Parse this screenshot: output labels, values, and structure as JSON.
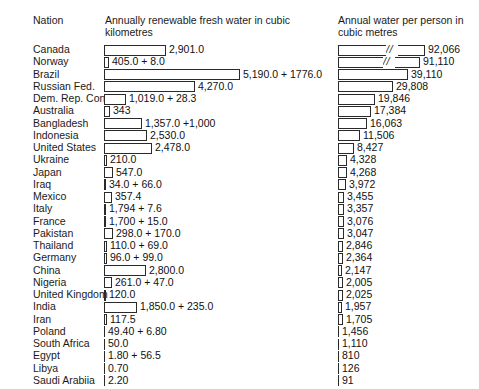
{
  "headers": {
    "nation": "Nation",
    "middle": "Annually renewable fresh water in cubic kilometres",
    "right": "Annual water per person in cubic metres"
  },
  "chart_data": {
    "type": "bar",
    "title": "",
    "orientation": "horizontal",
    "grid": false,
    "legend": null,
    "panels": [
      {
        "name": "renewable_fresh_water",
        "xlabel": "Annually renewable fresh water in cubic kilometres",
        "unit": "cubic kilometres",
        "xlim": [
          0,
          7000
        ]
      },
      {
        "name": "water_per_person",
        "xlabel": "Annual water per person in cubic metres",
        "unit": "cubic metres",
        "xlim": [
          0,
          40000
        ],
        "note": "first two bars are axis-broken (// mark)"
      }
    ],
    "categories": [
      "Canada",
      "Norway",
      "Brazil",
      "Russian Fed.",
      "Dem. Rep. Congo",
      "Australia",
      "Bangladesh",
      "Indonesia",
      "United States",
      "Ukraine",
      "Japan",
      "Iraq",
      "Mexico",
      "Italy",
      "France",
      "Pakistan",
      "Thailand",
      "Germany",
      "China",
      "Nigeria",
      "United Kingdom",
      "India",
      "Iran",
      "Poland",
      "South Africa",
      "Egypt",
      "Libya",
      "Saudi Arabiia"
    ],
    "rows": [
      {
        "nation": "Canada",
        "mid_label": "2,901.0",
        "mid_value": 2901.0,
        "mid_bar_px": 62,
        "right_label": "92,066",
        "right_value": 92066,
        "right_bar_px": 87,
        "right_break": true
      },
      {
        "nation": "Norway",
        "mid_label": "405.0 + 8.0",
        "mid_value": 413.0,
        "mid_bar_px": 5,
        "right_label": "91,110",
        "right_value": 91110,
        "right_bar_px": 82,
        "right_break": true
      },
      {
        "nation": "Brazil",
        "mid_label": "5,190.0 + 1776.0",
        "mid_value": 6966.0,
        "mid_bar_px": 136,
        "right_label": "39,110",
        "right_value": 39110,
        "right_bar_px": 70,
        "right_break": false
      },
      {
        "nation": "Russian Fed.",
        "mid_label": "4,270.0",
        "mid_value": 4270.0,
        "mid_bar_px": 91,
        "right_label": "29,808",
        "right_value": 29808,
        "right_bar_px": 55,
        "right_break": false
      },
      {
        "nation": "Dem. Rep. Congo",
        "mid_label": "1,019.0 + 28.3",
        "mid_value": 1047.3,
        "mid_bar_px": 22,
        "right_label": "19,846",
        "right_value": 19846,
        "right_bar_px": 37,
        "right_break": false
      },
      {
        "nation": "Australia",
        "mid_label": "343",
        "mid_value": 343.0,
        "mid_bar_px": 6,
        "right_label": "17,384",
        "right_value": 17384,
        "right_bar_px": 33,
        "right_break": false
      },
      {
        "nation": "Bangladesh",
        "mid_label": "1,357.0 +1,000",
        "mid_value": 2357.0,
        "mid_bar_px": 38,
        "right_label": "16,063",
        "right_value": 16063,
        "right_bar_px": 29,
        "right_break": false
      },
      {
        "nation": "Indonesia",
        "mid_label": "2,530.0",
        "mid_value": 2530.0,
        "mid_bar_px": 43,
        "right_label": "11,506",
        "right_value": 11506,
        "right_bar_px": 22,
        "right_break": false
      },
      {
        "nation": "United States",
        "mid_label": "2,478.0",
        "mid_value": 2478.0,
        "mid_bar_px": 48,
        "right_label": "8,427",
        "right_value": 8427,
        "right_bar_px": 16,
        "right_break": false
      },
      {
        "nation": "Ukraine",
        "mid_label": "210.0",
        "mid_value": 210.0,
        "mid_bar_px": 3,
        "right_label": "4,328",
        "right_value": 4328,
        "right_bar_px": 9,
        "right_break": false
      },
      {
        "nation": "Japan",
        "mid_label": "547.0",
        "mid_value": 547.0,
        "mid_bar_px": 9,
        "right_label": "4,268",
        "right_value": 4268,
        "right_bar_px": 9,
        "right_break": false
      },
      {
        "nation": "Iraq",
        "mid_label": "34.0 + 66.0",
        "mid_value": 100.0,
        "mid_bar_px": 2,
        "right_label": "3,972",
        "right_value": 3972,
        "right_bar_px": 8,
        "right_break": false
      },
      {
        "nation": "Mexico",
        "mid_label": "357.4",
        "mid_value": 357.4,
        "mid_bar_px": 8,
        "right_label": "3,455",
        "right_value": 3455,
        "right_bar_px": 6,
        "right_break": false
      },
      {
        "nation": "Italy",
        "mid_label": "1,794 + 7.6",
        "mid_value": 1801.6,
        "mid_bar_px": 2,
        "right_label": "3,357",
        "right_value": 3357,
        "right_bar_px": 6,
        "right_break": false
      },
      {
        "nation": "France",
        "mid_label": "1,700 + 15.0",
        "mid_value": 1715.0,
        "mid_bar_px": 2,
        "right_label": "3,076",
        "right_value": 3076,
        "right_bar_px": 6,
        "right_break": false
      },
      {
        "nation": "Pakistan",
        "mid_label": "298.0 + 170.0",
        "mid_value": 468.0,
        "mid_bar_px": 9,
        "right_label": "3,047",
        "right_value": 3047,
        "right_bar_px": 6,
        "right_break": false
      },
      {
        "nation": "Thailand",
        "mid_label": "110.0 + 69.0",
        "mid_value": 179.0,
        "mid_bar_px": 3,
        "right_label": "2,846",
        "right_value": 2846,
        "right_bar_px": 5,
        "right_break": false
      },
      {
        "nation": "Germany",
        "mid_label": "96.0 + 99.0",
        "mid_value": 195.0,
        "mid_bar_px": 3,
        "right_label": "2,364",
        "right_value": 2364,
        "right_bar_px": 5,
        "right_break": false
      },
      {
        "nation": "China",
        "mid_label": "2,800.0",
        "mid_value": 2800.0,
        "mid_bar_px": 42,
        "right_label": "2,147",
        "right_value": 2147,
        "right_bar_px": 4,
        "right_break": false
      },
      {
        "nation": "Nigeria",
        "mid_label": "261.0 + 47.0",
        "mid_value": 308.0,
        "mid_bar_px": 8,
        "right_label": "2,005",
        "right_value": 2005,
        "right_bar_px": 5,
        "right_break": false
      },
      {
        "nation": "United Kingdom",
        "mid_label": "120.0",
        "mid_value": 120.0,
        "mid_bar_px": 2,
        "right_label": "2,025",
        "right_value": 2025,
        "right_bar_px": 5,
        "right_break": false
      },
      {
        "nation": "India",
        "mid_label": "1,850.0 + 235.0",
        "mid_value": 2085.0,
        "mid_bar_px": 33,
        "right_label": "1,957",
        "right_value": 1957,
        "right_bar_px": 4,
        "right_break": false
      },
      {
        "nation": "Iran",
        "mid_label": "117.5",
        "mid_value": 117.5,
        "mid_bar_px": 3,
        "right_label": "1,705",
        "right_value": 1705,
        "right_bar_px": 5,
        "right_break": false
      },
      {
        "nation": "Poland",
        "mid_label": "49.40 + 6.80",
        "mid_value": 56.2,
        "mid_bar_px": 0,
        "right_label": "1,456",
        "right_value": 1456,
        "right_bar_px": 0,
        "right_break": false
      },
      {
        "nation": "South Africa",
        "mid_label": "50.0",
        "mid_value": 50.0,
        "mid_bar_px": 0,
        "right_label": "1,110",
        "right_value": 1110,
        "right_bar_px": 0,
        "right_break": false
      },
      {
        "nation": "Egypt",
        "mid_label": "1.80 + 56.5",
        "mid_value": 58.3,
        "mid_bar_px": 0,
        "right_label": "810",
        "right_value": 810,
        "right_bar_px": 0,
        "right_break": false
      },
      {
        "nation": "Libya",
        "mid_label": "0.70",
        "mid_value": 0.7,
        "mid_bar_px": 0,
        "right_label": "126",
        "right_value": 126,
        "right_bar_px": 0,
        "right_break": false
      },
      {
        "nation": "Saudi Arabiia",
        "mid_label": "2.20",
        "mid_value": 2.2,
        "mid_bar_px": 0,
        "right_label": "91",
        "right_value": 91,
        "right_bar_px": 0,
        "right_break": false
      }
    ]
  },
  "break_glyph": "//"
}
